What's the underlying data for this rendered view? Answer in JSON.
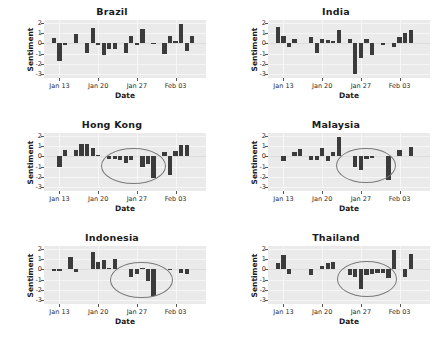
{
  "figure": {
    "background_color": "#ffffff",
    "panel_background_color": "#eaeaea",
    "bar_color": "#3b3b3b",
    "annotation_color": "#7a7a7a",
    "rows": 3,
    "cols": 2
  },
  "axis": {
    "ylabel": "Sentiment",
    "xlabel": "Date",
    "yticks": [
      "2",
      "1",
      "0",
      "-1",
      "-2",
      "-3"
    ],
    "ytick_values": [
      2,
      1,
      0,
      -1,
      -2,
      -3
    ],
    "ylim": [
      -3.4,
      2.3
    ],
    "xticks": [
      "Jan 13",
      "Jan 20",
      "Jan 27",
      "Feb 03"
    ],
    "xtick_positions": [
      2,
      9,
      16,
      23
    ],
    "xlim": [
      -0.8,
      28.5
    ],
    "grid": true
  },
  "chart_data": [
    {
      "type": "bar",
      "title": "Brazil",
      "xlabel": "Date",
      "ylabel": "Sentiment",
      "ylim": [
        -3.4,
        2.3
      ],
      "xticklabels": [
        "Jan 13",
        "Jan 20",
        "Jan 27",
        "Feb 03"
      ],
      "x": [
        1,
        2,
        3,
        5,
        7,
        8,
        9,
        10,
        11,
        12,
        14,
        15,
        16,
        17,
        19,
        21,
        22,
        23,
        24,
        25,
        26
      ],
      "values": [
        0.5,
        -1.7,
        0.0,
        0.9,
        -0.9,
        1.5,
        0.0,
        -1.1,
        -0.6,
        -0.6,
        -0.9,
        0.7,
        0.0,
        1.4,
        0.05,
        -1.0,
        0.7,
        0.2,
        1.9,
        -0.7,
        0.7
      ],
      "annotation": null
    },
    {
      "type": "bar",
      "title": "India",
      "xlabel": "Date",
      "ylabel": "Sentiment",
      "ylim": [
        -3.4,
        2.3
      ],
      "xticklabels": [
        "Jan 13",
        "Jan 20",
        "Jan 27",
        "Feb 03"
      ],
      "x": [
        1,
        2,
        3,
        4,
        7,
        8,
        9,
        10,
        11,
        12,
        14,
        15,
        16,
        17,
        18,
        20,
        22,
        23,
        24,
        25
      ],
      "values": [
        1.6,
        0.7,
        -0.4,
        0.4,
        0.6,
        -0.9,
        0.4,
        0.3,
        0.2,
        1.3,
        0.4,
        -3.0,
        -1.4,
        0.4,
        -1.1,
        -0.15,
        -0.35,
        0.6,
        1.0,
        1.3
      ],
      "annotation": null
    },
    {
      "type": "bar",
      "title": "Hong Kong",
      "xlabel": "Date",
      "ylabel": "Sentiment",
      "ylim": [
        -3.4,
        2.3
      ],
      "xticklabels": [
        "Jan 13",
        "Jan 20",
        "Jan 27",
        "Feb 03"
      ],
      "x": [
        2,
        3,
        5,
        6,
        7,
        8,
        9,
        11,
        12,
        13,
        14,
        15,
        17,
        18,
        19,
        21,
        22,
        23,
        24,
        25
      ],
      "values": [
        -1.0,
        0.6,
        0.6,
        1.2,
        1.2,
        0.8,
        0.15,
        -0.25,
        -0.3,
        -0.35,
        -0.65,
        -0.35,
        -1.0,
        -0.7,
        -2.1,
        0.4,
        -1.8,
        0.5,
        1.1,
        1.1
      ],
      "annotation": {
        "shape": "ellipse",
        "center_x": 15.2,
        "center_y": -0.85,
        "width_x": 11.5,
        "height_y": 3.4
      }
    },
    {
      "type": "bar",
      "title": "Malaysia",
      "xlabel": "Date",
      "ylabel": "Sentiment",
      "ylim": [
        -3.4,
        2.3
      ],
      "xticklabels": [
        "Jan 13",
        "Jan 20",
        "Jan 27",
        "Feb 03"
      ],
      "x": [
        2,
        4,
        5,
        7,
        8,
        9,
        10,
        11,
        12,
        15,
        16,
        17,
        18,
        21,
        23,
        25
      ],
      "values": [
        -0.5,
        0.4,
        0.7,
        -0.35,
        -0.4,
        0.8,
        -0.45,
        0.4,
        1.9,
        -1.0,
        -1.3,
        -0.25,
        -0.2,
        -2.3,
        0.6,
        0.9
      ],
      "annotation": {
        "shape": "ellipse",
        "center_x": 16.8,
        "center_y": -0.8,
        "width_x": 10.5,
        "height_y": 3.3
      }
    },
    {
      "type": "bar",
      "title": "Indonesia",
      "xlabel": "Date",
      "ylabel": "Sentiment",
      "ylim": [
        -3.4,
        2.3
      ],
      "xticklabels": [
        "Jan 13",
        "Jan 20",
        "Jan 27",
        "Feb 03"
      ],
      "x": [
        1,
        2,
        4,
        5,
        8,
        9,
        10,
        11,
        12,
        15,
        16,
        17,
        18,
        19,
        22,
        24,
        25
      ],
      "values": [
        -0.2,
        -0.15,
        1.2,
        -0.3,
        1.7,
        0.7,
        0.9,
        0.15,
        1.0,
        -0.7,
        -0.45,
        0.15,
        -1.1,
        -2.6,
        0.05,
        -0.4,
        -0.45
      ],
      "annotation": {
        "shape": "ellipse",
        "center_x": 16.6,
        "center_y": -0.95,
        "width_x": 11.0,
        "height_y": 3.4
      }
    },
    {
      "type": "bar",
      "title": "Thailand",
      "xlabel": "Date",
      "ylabel": "Sentiment",
      "ylim": [
        -3.4,
        2.3
      ],
      "xticklabels": [
        "Jan 13",
        "Jan 20",
        "Jan 27",
        "Feb 03"
      ],
      "x": [
        1,
        2,
        3,
        7,
        9,
        10,
        11,
        14,
        15,
        16,
        17,
        18,
        19,
        20,
        21,
        22,
        24,
        25
      ],
      "values": [
        0.6,
        1.4,
        -0.5,
        -0.6,
        0.3,
        0.6,
        0.7,
        -0.6,
        -0.7,
        -1.9,
        -0.6,
        -0.5,
        -0.4,
        -0.35,
        -0.8,
        1.9,
        -0.7,
        1.5
      ],
      "annotation": {
        "shape": "ellipse",
        "center_x": 17.0,
        "center_y": -0.85,
        "width_x": 10.5,
        "height_y": 3.3
      }
    }
  ]
}
